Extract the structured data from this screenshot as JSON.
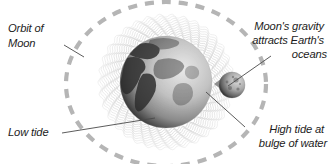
{
  "figure": {
    "background_color": "#ffffff",
    "orbit_color": "#b5b5b5",
    "wave_color": "#c8c8c8",
    "leader_color": "#555555",
    "arrow_color": "#8c8c8c",
    "text_color": "#1c1c1c"
  },
  "labels": {
    "orbit_of_moon": {
      "lines": [
        "Orbit of",
        "Moon"
      ],
      "line1": "Orbit of",
      "line2": "Moon",
      "align": "left"
    },
    "moons_gravity": {
      "lines": [
        "Moon's gravity",
        "attracts Earth's",
        "oceans"
      ],
      "line1": "Moon's gravity",
      "line2": "attracts Earth's",
      "line3": "oceans",
      "align": "right"
    },
    "low_tide": {
      "lines": [
        "Low tide"
      ],
      "line1": "Low tide",
      "align": "left"
    },
    "high_tide": {
      "lines": [
        "High tide at",
        "bulge of water"
      ],
      "line1": "High tide at",
      "line2": "bulge of water",
      "align": "right"
    }
  },
  "bodies": {
    "earth": {
      "name": "Earth",
      "cx": 166,
      "cy": 82,
      "r": 46
    },
    "moon": {
      "name": "Moon",
      "cx": 232,
      "cy": 85,
      "r": 13
    }
  },
  "orbit": {
    "name": "Moon orbit path",
    "cx": 166,
    "cy": 84,
    "rx": 100,
    "ry": 82,
    "dashed": true
  },
  "arrow": {
    "name": "gravity-pull-arrow",
    "direction": "left",
    "from": "Moon",
    "to": "Earth"
  }
}
